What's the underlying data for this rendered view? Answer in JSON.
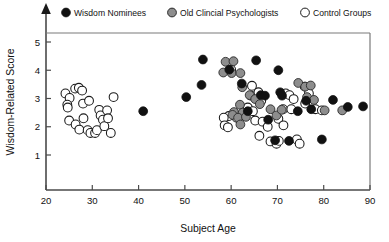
{
  "chart_data": {
    "type": "scatter",
    "title": "",
    "xlabel": "Subject Age",
    "ylabel": "Wisdom-Related Score",
    "xlim": [
      20,
      90
    ],
    "ylim": [
      0.35,
      5.6
    ],
    "xticks": [
      20,
      30,
      40,
      50,
      60,
      70,
      80,
      90
    ],
    "yticks": [
      1,
      2,
      3,
      4,
      5
    ],
    "grid": false,
    "legend_position": "top",
    "series": [
      {
        "name": "Wisdom Nominees",
        "marker": "filled-circle",
        "color": "#111111",
        "points": [
          [
            41.0,
            2.55
          ],
          [
            50.3,
            3.05
          ],
          [
            53.6,
            3.48
          ],
          [
            53.9,
            4.38
          ],
          [
            59.6,
            4.02
          ],
          [
            62.3,
            3.53
          ],
          [
            63.6,
            2.55
          ],
          [
            65.4,
            4.35
          ],
          [
            66.4,
            3.12
          ],
          [
            67.3,
            3.1
          ],
          [
            68.0,
            2.25
          ],
          [
            69.5,
            1.52
          ],
          [
            70.2,
            4.0
          ],
          [
            70.6,
            3.22
          ],
          [
            71.0,
            3.1
          ],
          [
            72.5,
            1.5
          ],
          [
            74.4,
            2.55
          ],
          [
            76.2,
            2.92
          ],
          [
            77.3,
            2.62
          ],
          [
            79.6,
            1.55
          ],
          [
            82.0,
            2.95
          ],
          [
            85.2,
            2.7
          ],
          [
            88.5,
            2.72
          ]
        ]
      },
      {
        "name": "Old Clincial Psychologists",
        "marker": "gray-circle",
        "color": "#8d8d8d",
        "points": [
          [
            58.8,
            4.3
          ],
          [
            60.5,
            4.32
          ],
          [
            58.3,
            3.92
          ],
          [
            60.1,
            3.9
          ],
          [
            62.0,
            3.9
          ],
          [
            62.4,
            3.4
          ],
          [
            64.0,
            3.12
          ],
          [
            65.2,
            2.98
          ],
          [
            61.9,
            2.78
          ],
          [
            60.6,
            2.52
          ],
          [
            62.5,
            2.5
          ],
          [
            60.3,
            2.42
          ],
          [
            61.5,
            2.32
          ],
          [
            63.2,
            2.35
          ],
          [
            62.0,
            2.08
          ],
          [
            66.2,
            2.8
          ],
          [
            68.5,
            2.62
          ],
          [
            69.8,
            2.4
          ],
          [
            70.9,
            2.6
          ],
          [
            74.5,
            3.55
          ],
          [
            76.0,
            3.42
          ],
          [
            77.2,
            3.46
          ],
          [
            76.4,
            3.05
          ],
          [
            77.9,
            2.95
          ],
          [
            80.2,
            2.58
          ],
          [
            84.0,
            2.58
          ]
        ]
      },
      {
        "name": "Control Groups",
        "marker": "open-circle",
        "color": "#ffffff",
        "points": [
          [
            24.2,
            3.18
          ],
          [
            25.1,
            3.02
          ],
          [
            24.6,
            2.78
          ],
          [
            24.7,
            2.68
          ],
          [
            25.0,
            2.22
          ],
          [
            26.3,
            3.35
          ],
          [
            27.1,
            3.38
          ],
          [
            27.8,
            3.28
          ],
          [
            26.4,
            2.08
          ],
          [
            27.2,
            1.9
          ],
          [
            28.0,
            2.82
          ],
          [
            29.3,
            2.92
          ],
          [
            28.1,
            2.3
          ],
          [
            29.0,
            1.88
          ],
          [
            29.6,
            1.78
          ],
          [
            30.6,
            1.78
          ],
          [
            31.0,
            1.88
          ],
          [
            31.5,
            2.6
          ],
          [
            31.8,
            2.4
          ],
          [
            32.3,
            2.25
          ],
          [
            32.6,
            2.02
          ],
          [
            33.2,
            2.58
          ],
          [
            33.4,
            2.3
          ],
          [
            34.0,
            1.78
          ],
          [
            34.6,
            3.05
          ],
          [
            60.0,
            4.02
          ],
          [
            64.5,
            3.45
          ],
          [
            64.3,
            3.1
          ],
          [
            65.9,
            3.22
          ],
          [
            66.5,
            2.92
          ],
          [
            63.6,
            2.68
          ],
          [
            64.7,
            2.55
          ],
          [
            62.9,
            2.4
          ],
          [
            61.2,
            2.32
          ],
          [
            59.5,
            2.38
          ],
          [
            58.4,
            2.32
          ],
          [
            58.6,
            2.05
          ],
          [
            59.3,
            1.98
          ],
          [
            65.2,
            2.22
          ],
          [
            66.8,
            2.18
          ],
          [
            67.9,
            2.0
          ],
          [
            66.1,
            1.68
          ],
          [
            68.5,
            1.48
          ],
          [
            69.8,
            1.4
          ],
          [
            70.3,
            1.5
          ],
          [
            71.8,
            3.18
          ],
          [
            72.6,
            3.12
          ],
          [
            73.5,
            2.98
          ],
          [
            71.2,
            2.62
          ],
          [
            73.0,
            2.62
          ],
          [
            70.2,
            2.28
          ],
          [
            71.3,
            2.05
          ],
          [
            74.2,
            1.55
          ],
          [
            74.8,
            1.4
          ],
          [
            75.9,
            3.42
          ],
          [
            76.8,
            3.18
          ],
          [
            76.0,
            2.82
          ],
          [
            78.2,
            2.62
          ],
          [
            79.6,
            2.58
          ]
        ]
      }
    ]
  },
  "legend": {
    "items": [
      {
        "label": "Wisdom Nominees",
        "marker": "filled-circle"
      },
      {
        "label": "Old Clincial Psychologists",
        "marker": "gray-circle"
      },
      {
        "label": "Control Groups",
        "marker": "open-circle"
      }
    ]
  },
  "axes": {
    "x_title": "Subject Age",
    "y_title": "Wisdom-Related Score",
    "x_tick_labels": [
      "20",
      "30",
      "40",
      "50",
      "60",
      "70",
      "80",
      "90"
    ],
    "y_tick_labels": [
      "1",
      "2",
      "3",
      "4",
      "5"
    ]
  },
  "colors": {
    "nominee": "#111111",
    "psychologist": "#8d8d8d",
    "control": "#ffffff",
    "stroke": "#1a1a1a",
    "frame": "#4a4a4a"
  }
}
